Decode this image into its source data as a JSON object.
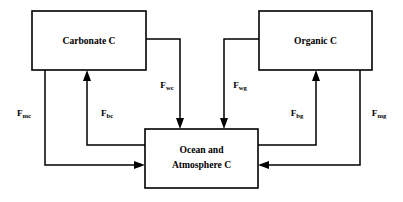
{
  "diagram": {
    "background_color": "#ffffff",
    "line_color": "#000000",
    "boxes": [
      {
        "id": "carbonate",
        "name": "carbonate-reservoir-box",
        "lines": [
          "Carbonate  C"
        ],
        "x": 32,
        "y": 11,
        "width": 114,
        "height": 59
      },
      {
        "id": "organic",
        "name": "organic-reservoir-box",
        "lines": [
          "Organic C"
        ],
        "x": 259,
        "y": 11,
        "width": 113,
        "height": 59
      },
      {
        "id": "ocean_atmosphere",
        "name": "ocean-atmosphere-reservoir-box",
        "lines": [
          "Ocean and",
          "Atmosphere C"
        ],
        "x": 145,
        "y": 129,
        "width": 113,
        "height": 59
      }
    ],
    "fluxes": [
      {
        "id": "fwc",
        "symbol": "F",
        "subscript": "wc",
        "from": "carbonate",
        "to": "ocean_atmosphere",
        "label_x": 167,
        "label_y": 88
      },
      {
        "id": "fwg",
        "symbol": "F",
        "subscript": "wg",
        "from": "organic",
        "to": "ocean_atmosphere",
        "label_x": 240,
        "label_y": 88
      },
      {
        "id": "fmc",
        "symbol": "F",
        "subscript": "mc",
        "from": "carbonate",
        "to": "ocean_atmosphere",
        "label_x": 24,
        "label_y": 116
      },
      {
        "id": "fbc",
        "symbol": "F",
        "subscript": "bc",
        "from": "ocean_atmosphere",
        "to": "carbonate",
        "label_x": 107,
        "label_y": 116
      },
      {
        "id": "fbg",
        "symbol": "F",
        "subscript": "bg",
        "from": "ocean_atmosphere",
        "to": "organic",
        "label_x": 297,
        "label_y": 116
      },
      {
        "id": "fmg",
        "symbol": "F",
        "subscript": "mg",
        "from": "organic",
        "to": "ocean_atmosphere",
        "label_x": 379,
        "label_y": 116
      }
    ]
  }
}
